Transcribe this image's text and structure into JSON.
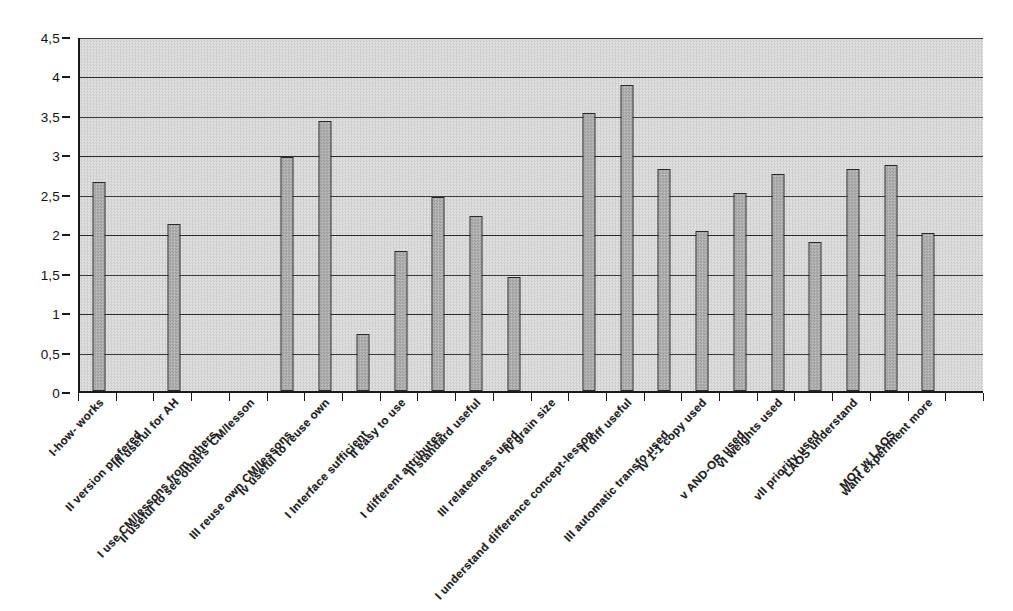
{
  "chart_data": {
    "type": "bar",
    "title": "",
    "subtitle": "",
    "xlabel": "",
    "ylabel": "",
    "ylim": [
      0,
      4.5
    ],
    "ytick_values": [
      0,
      0.5,
      1,
      1.5,
      2,
      2.5,
      3,
      3.5,
      4,
      4.5
    ],
    "ytick_labels": [
      "0",
      "0,5",
      "1",
      "1,5",
      "2",
      "2,5",
      "3",
      "3,5",
      "4",
      "4,5"
    ],
    "grid": true,
    "legend": "none",
    "decimal_separator": ",",
    "categories": [
      "I-how- works",
      "II version prefered",
      "III useful for AH",
      "I use CM/lessons from others",
      "II useful to see others' CM/lesson",
      "III reuse own CM/lessons",
      "Iv useful to reuse own",
      "I Interface sufficient",
      "II easy to use",
      "I different attributes",
      "II standard useful",
      "III relatedness used",
      "Iv grain size",
      "I understand difference concept-lesson",
      "II diff useful",
      "III automatic transfo used",
      "Iv 1-1 copy used",
      "v AND-OR used",
      "vI weights used",
      "vII priority used",
      "LAOS understand",
      "MOT w LAOS",
      "want experiment more"
    ],
    "values": [
      2.65,
      0,
      2.12,
      0,
      0,
      2.97,
      3.42,
      0.72,
      1.78,
      2.46,
      2.22,
      1.44,
      0,
      3.52,
      3.88,
      2.82,
      2.03,
      2.51,
      2.75,
      1.89,
      2.81,
      2.87,
      2.0
    ],
    "bar_color": "#b0b0b0",
    "bar_edge_color": "#2a2a2a",
    "plot_background_color": "#d8d8d8",
    "axis_color": "#1a1a1a"
  }
}
